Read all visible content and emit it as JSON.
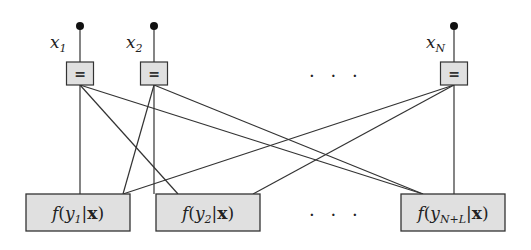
{
  "variables": [
    {
      "id": "x1",
      "name": "x",
      "sub": "1",
      "cx": 80,
      "dotY": 26,
      "labelX": 50
    },
    {
      "id": "x2",
      "name": "x",
      "sub": "2",
      "cx": 154,
      "dotY": 26,
      "labelX": 126
    },
    {
      "id": "xN",
      "name": "x",
      "sub": "N",
      "cx": 454,
      "dotY": 26,
      "labelX": 426
    }
  ],
  "equality_symbol": "=",
  "equality_nodes": {
    "y": 62,
    "h": 23,
    "w": 27
  },
  "factor_nodes": [
    {
      "id": "f1",
      "label_f": "f(",
      "label_y": "y",
      "sub": "1",
      "label_rest": "|x)",
      "x": 26,
      "w": 104,
      "y": 194,
      "h": 37
    },
    {
      "id": "f2",
      "label_f": "f(",
      "label_y": "y",
      "sub": "2",
      "label_rest": "|x)",
      "x": 156,
      "w": 104,
      "y": 194,
      "h": 37
    },
    {
      "id": "fNL",
      "label_f": "f(",
      "label_y": "y",
      "sub": "N+L",
      "label_rest": "|x)",
      "x": 401,
      "w": 104,
      "y": 194,
      "h": 37
    }
  ],
  "ellipsis_top": "· · ·",
  "ellipsis_bottom": "· · ·",
  "colors": {
    "box_fill": "#e0e0e0",
    "stroke": "#333333"
  },
  "edges": [
    [
      "x1",
      "f1"
    ],
    [
      "x1",
      "f2"
    ],
    [
      "x1",
      "fNL"
    ],
    [
      "x2",
      "f1"
    ],
    [
      "x2",
      "f2"
    ],
    [
      "x2",
      "fNL"
    ],
    [
      "xN",
      "f1"
    ],
    [
      "xN",
      "f2"
    ],
    [
      "xN",
      "fNL"
    ]
  ]
}
